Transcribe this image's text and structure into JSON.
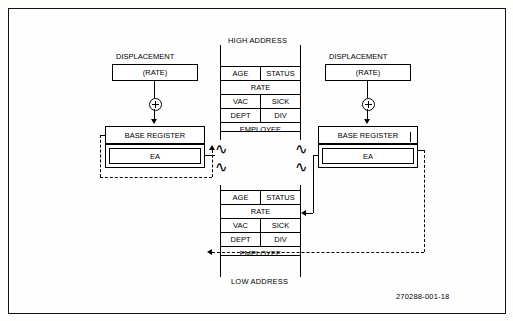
{
  "figure": {
    "id_tag": "270288-001-18",
    "memory_labels": {
      "high": "HIGH ADDRESS",
      "low": "LOW ADDRESS"
    },
    "left": {
      "displacement_label": "DISPLACEMENT",
      "rate_label": "(RATE)",
      "base_register_label": "BASE REGISTER",
      "ea_label": "EA",
      "adder_icon": "plus-circle-icon"
    },
    "right": {
      "displacement_label": "DISPLACEMENT",
      "rate_label": "(RATE)",
      "base_register_label": "BASE REGISTER",
      "ea_label": "EA",
      "adder_icon": "plus-circle-icon"
    },
    "record_upper": {
      "rows": [
        {
          "cells": [
            "AGE",
            "STATUS"
          ]
        },
        {
          "cells": [
            "RATE"
          ]
        },
        {
          "cells": [
            "VAC",
            "SICK"
          ]
        },
        {
          "cells": [
            "DEPT",
            "DIV"
          ]
        },
        {
          "cells": [
            "EMPLOYEE"
          ]
        }
      ]
    },
    "record_lower": {
      "rows": [
        {
          "cells": [
            "AGE",
            "STATUS"
          ]
        },
        {
          "cells": [
            "RATE"
          ]
        },
        {
          "cells": [
            "VAC",
            "SICK"
          ]
        },
        {
          "cells": [
            "DEPT",
            "DIV"
          ]
        },
        {
          "cells": [
            "EMPLOYEE"
          ]
        }
      ]
    }
  }
}
